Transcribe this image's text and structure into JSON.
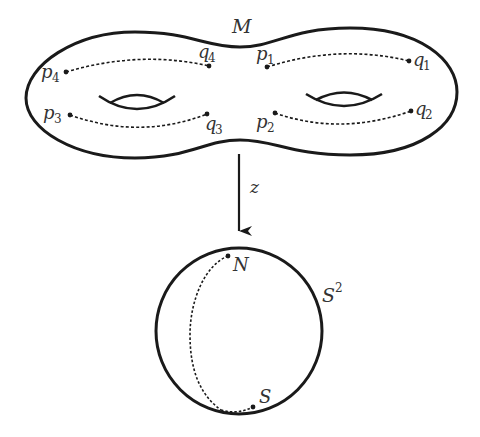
{
  "diagram": {
    "surface": {
      "label": "M",
      "points": [
        {
          "name": "p",
          "sub": "4"
        },
        {
          "name": "q",
          "sub": "4"
        },
        {
          "name": "p",
          "sub": "1"
        },
        {
          "name": "q",
          "sub": "1"
        },
        {
          "name": "p",
          "sub": "3"
        },
        {
          "name": "q",
          "sub": "3"
        },
        {
          "name": "p",
          "sub": "2"
        },
        {
          "name": "q",
          "sub": "2"
        }
      ],
      "genus_holes": 2
    },
    "map": {
      "label": "z"
    },
    "sphere": {
      "label": "S",
      "label_sup": "2",
      "north": "N",
      "south": "S"
    },
    "colors": {
      "stroke": "#1a1a1a",
      "text": "#333333",
      "background": "#ffffff"
    }
  }
}
